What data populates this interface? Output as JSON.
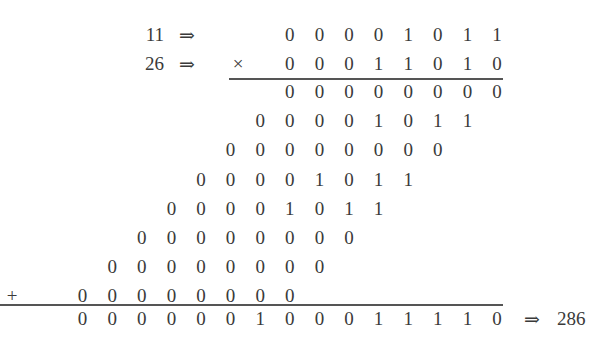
{
  "multiplication": {
    "multiplicand": {
      "decimal": "11",
      "bits": [
        "0",
        "0",
        "0",
        "0",
        "1",
        "0",
        "1",
        "1"
      ]
    },
    "multiplier": {
      "decimal": "26",
      "bits": [
        "0",
        "0",
        "0",
        "1",
        "1",
        "0",
        "1",
        "0"
      ]
    },
    "times_symbol": "×",
    "plus_symbol": "+",
    "arrow_symbol": "⇒",
    "partial_products": [
      [
        "0",
        "0",
        "0",
        "0",
        "0",
        "0",
        "0",
        "0"
      ],
      [
        "0",
        "0",
        "0",
        "0",
        "1",
        "0",
        "1",
        "1"
      ],
      [
        "0",
        "0",
        "0",
        "0",
        "0",
        "0",
        "0",
        "0"
      ],
      [
        "0",
        "0",
        "0",
        "0",
        "1",
        "0",
        "1",
        "1"
      ],
      [
        "0",
        "0",
        "0",
        "0",
        "1",
        "0",
        "1",
        "1"
      ],
      [
        "0",
        "0",
        "0",
        "0",
        "0",
        "0",
        "0",
        "0"
      ],
      [
        "0",
        "0",
        "0",
        "0",
        "0",
        "0",
        "0",
        "0"
      ],
      [
        "0",
        "0",
        "0",
        "0",
        "0",
        "0",
        "0",
        "0"
      ]
    ],
    "result": {
      "bits": [
        "0",
        "0",
        "0",
        "0",
        "0",
        "0",
        "1",
        "0",
        "0",
        "0",
        "1",
        "1",
        "1",
        "1",
        "0"
      ],
      "decimal": "286"
    }
  }
}
